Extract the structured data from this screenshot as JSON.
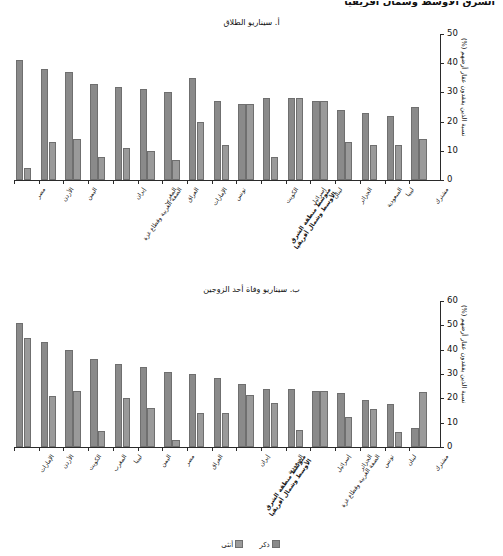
{
  "figure": {
    "top_heading": "الشرق الأوسط وشمال أفريقيا",
    "legend": {
      "male_label": "ذكر",
      "female_label": "أنثى"
    },
    "colors": {
      "male": "#8a8a8a",
      "female": "#9a9a9a",
      "axis": "#2a2a2a"
    }
  },
  "chart_data": [
    {
      "type": "bar",
      "id": "panel-a",
      "title": "أ. سيناريو الطلاق",
      "xlabel": "",
      "ylabel": "نسبة الذين يفقدون عقار أرضهم (%)",
      "ylim": [
        0,
        50
      ],
      "yticks": [
        0,
        10,
        20,
        30,
        40,
        50
      ],
      "grid": false,
      "legend_position": "bottom",
      "categories": [
        "مصر",
        "الأردن",
        "اليمن",
        "الضفة الغربية وقطاع غزة",
        "إيران",
        "المغرب",
        "العراق",
        "الإمارات",
        "تونس",
        "متوسط منطقة الشرق الأوسط وشمال أفريقيا",
        "الكويت",
        "إسرائيل",
        "لبنان",
        "الجزائر",
        "السعودية",
        "ليبيا",
        "مشترك"
      ],
      "series": [
        {
          "name": "ذكر",
          "values": [
            41,
            38,
            37,
            33,
            32,
            31,
            30,
            35,
            27,
            26,
            28,
            28,
            27,
            24,
            23,
            22,
            25
          ]
        },
        {
          "name": "أنثى",
          "values": [
            4,
            13,
            14,
            8,
            11,
            10,
            7,
            20,
            12,
            26,
            8,
            28,
            27,
            13,
            12,
            12,
            14
          ]
        }
      ]
    },
    {
      "type": "bar",
      "id": "panel-b",
      "title": "ب. سيناريو وفاة أحد الزوجين",
      "xlabel": "",
      "ylabel": "نسبة الذين يفقدون عقار أرضهم (%)",
      "ylim": [
        0,
        60
      ],
      "yticks": [
        0,
        10,
        20,
        30,
        40,
        50,
        60
      ],
      "grid": false,
      "legend_position": "bottom",
      "categories": [
        "الإمارات",
        "الأردن",
        "الكويت",
        "المغرب",
        "ليبيا",
        "اليمن",
        "مصر",
        "العراق",
        "متوسط منطقة الشرق الأوسط وشمال أفريقيا",
        "إيران",
        "السعودية",
        "الضفة الغربية وقطاع غزة",
        "إسرائيل",
        "الجزائر",
        "تونس",
        "لبنان",
        "مشترك"
      ],
      "series": [
        {
          "name": "ذكر",
          "values": [
            51,
            43,
            40,
            36,
            34,
            33,
            31,
            30,
            28.5,
            26,
            24,
            24,
            23,
            22,
            19.5,
            17.5,
            8
          ]
        },
        {
          "name": "أنثى",
          "values": [
            45,
            21,
            23,
            6.5,
            20,
            16,
            3,
            14,
            14,
            21.5,
            18,
            7,
            23,
            12.5,
            15.5,
            6,
            22.5
          ]
        }
      ]
    }
  ]
}
